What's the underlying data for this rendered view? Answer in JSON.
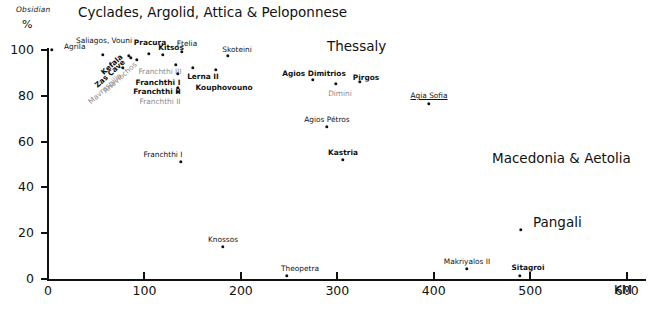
{
  "axes": {
    "y_title": "Obsidian",
    "y_unit": "%",
    "x_unit": "KM",
    "y_ticks": [
      "0",
      "20",
      "40",
      "60",
      "80",
      "100"
    ],
    "x_ticks": [
      "0",
      "100",
      "200",
      "300",
      "400",
      "500",
      "600"
    ]
  },
  "regions": [
    {
      "name": "Cyclades, Argolid, Attica & Peloponnese",
      "x": 78,
      "y": 4
    },
    {
      "name": "Thessaly",
      "x": 327,
      "y": 38
    },
    {
      "name": "Macedonia & Aetolia",
      "x": 492,
      "y": 150
    },
    {
      "name": "Pangali",
      "x": 533,
      "y": 214
    }
  ],
  "chart_data": {
    "type": "scatter",
    "xlabel": "KM",
    "ylabel": "Obsidian %",
    "xlim": [
      0,
      620
    ],
    "ylim": [
      0,
      105
    ],
    "grid": false,
    "legend": "none",
    "points": [
      {
        "label": "Agrila",
        "x": 6,
        "y": 100,
        "px": 52,
        "py": 50,
        "lx": 64,
        "ly": 43,
        "anchor": "left",
        "style": "plain"
      },
      {
        "label": "Saliagos, Vouni",
        "x": 55,
        "y": 97,
        "px": 103,
        "py": 55,
        "lx": 104,
        "ly": 37,
        "anchor": "center",
        "style": "plain"
      },
      {
        "label": "Kefala",
        "x": 82,
        "y": 96,
        "px": 129,
        "py": 56,
        "lx": 112,
        "ly": 61,
        "anchor": "center",
        "style": "rot"
      },
      {
        "label": "Zas Cave",
        "x": 84,
        "y": 94,
        "px": 131,
        "py": 58,
        "lx": 110,
        "ly": 70,
        "anchor": "center",
        "style": "rot"
      },
      {
        "label": "Anavlochos",
        "x": 90,
        "y": 92,
        "px": 137,
        "py": 60,
        "lx": 120,
        "ly": 74,
        "anchor": "center",
        "style": "rot grey"
      },
      {
        "label": "Mavrospilia",
        "x": 76,
        "y": 88,
        "px": 123,
        "py": 68,
        "lx": 105,
        "ly": 85,
        "anchor": "center",
        "style": "rot grey"
      },
      {
        "label": "Pracura",
        "x": 104,
        "y": 97,
        "px": 149,
        "py": 54,
        "lx": 150,
        "ly": 39,
        "anchor": "center",
        "style": "bold"
      },
      {
        "label": "Kitsos",
        "x": 118,
        "y": 96,
        "px": 163,
        "py": 55,
        "lx": 171,
        "ly": 44,
        "anchor": "center",
        "style": "bold"
      },
      {
        "label": "Ftelia",
        "x": 137,
        "y": 97,
        "px": 182,
        "py": 52,
        "lx": 187,
        "ly": 40,
        "anchor": "center",
        "style": "plain"
      },
      {
        "label": "Skoteini",
        "x": 183,
        "y": 96,
        "px": 228,
        "py": 56,
        "lx": 237,
        "ly": 46,
        "anchor": "center",
        "style": "plain"
      },
      {
        "label": "Franchthi III",
        "x": 131,
        "y": 90,
        "px": 176,
        "py": 65,
        "lx": 160,
        "ly": 68,
        "anchor": "center",
        "style": "grey"
      },
      {
        "label": "Franchthi I",
        "x": 133,
        "y": 86,
        "px": 178,
        "py": 74,
        "lx": 158,
        "ly": 79,
        "anchor": "center",
        "style": "bold"
      },
      {
        "label": "Lerna II",
        "x": 148,
        "y": 89,
        "px": 193,
        "py": 68,
        "lx": 203,
        "ly": 73,
        "anchor": "center",
        "style": "bold"
      },
      {
        "label": "Kouphovouno",
        "x": 171,
        "y": 88,
        "px": 216,
        "py": 70,
        "lx": 224,
        "ly": 84,
        "anchor": "center",
        "style": "bold"
      },
      {
        "label": "Franchthi II",
        "x": 133,
        "y": 82,
        "px": 178,
        "py": 88,
        "lx": 157,
        "ly": 88,
        "anchor": "center",
        "style": "bold"
      },
      {
        "label": "Franchthi II",
        "x": 133,
        "y": 80,
        "px": 178,
        "py": 92,
        "lx": 160,
        "ly": 98,
        "anchor": "center",
        "style": "grey"
      },
      {
        "label": "Agios Dimitrios",
        "x": 268,
        "y": 87,
        "px": 313,
        "py": 80,
        "lx": 314,
        "ly": 70,
        "anchor": "center",
        "style": "bold"
      },
      {
        "label": "Pirgos",
        "x": 315,
        "y": 86,
        "px": 360,
        "py": 82,
        "lx": 366,
        "ly": 74,
        "anchor": "center",
        "style": "bold"
      },
      {
        "label": "Dimini",
        "x": 291,
        "y": 85,
        "px": 336,
        "py": 84,
        "lx": 340,
        "ly": 90,
        "anchor": "center",
        "style": "grey"
      },
      {
        "label": "Agia Sofia",
        "x": 384,
        "y": 78,
        "px": 429,
        "py": 104,
        "lx": 429,
        "ly": 92,
        "anchor": "center",
        "style": "und"
      },
      {
        "label": "Agios Pétros",
        "x": 282,
        "y": 69,
        "px": 327,
        "py": 127,
        "lx": 327,
        "ly": 116,
        "anchor": "center",
        "style": "plain"
      },
      {
        "label": "Franchthi I",
        "x": 136,
        "y": 52,
        "px": 181,
        "py": 162,
        "lx": 163,
        "ly": 151,
        "anchor": "center",
        "style": "plain"
      },
      {
        "label": "Kastria",
        "x": 298,
        "y": 53,
        "px": 343,
        "py": 160,
        "lx": 343,
        "ly": 149,
        "anchor": "center",
        "style": "bold"
      },
      {
        "label": "Pangali",
        "x": 502,
        "y": 21,
        "px": 521,
        "py": 230,
        "lx": 521,
        "ly": 214,
        "anchor": "center",
        "style": "none"
      },
      {
        "label": "Knossos",
        "x": 178,
        "y": 13,
        "px": 223,
        "py": 247,
        "lx": 223,
        "ly": 236,
        "anchor": "center",
        "style": "plain"
      },
      {
        "label": "Makriyalos II",
        "x": 447,
        "y": 3,
        "px": 467,
        "py": 269,
        "lx": 467,
        "ly": 258,
        "anchor": "center",
        "style": "plain"
      },
      {
        "label": "Sitagroi",
        "x": 500,
        "y": 1,
        "px": 520,
        "py": 276,
        "lx": 528,
        "ly": 264,
        "anchor": "center",
        "style": "bold"
      },
      {
        "label": "Theopetra",
        "x": 254,
        "y": 1,
        "px": 287,
        "py": 276,
        "lx": 300,
        "ly": 265,
        "anchor": "center",
        "style": "plain"
      }
    ]
  }
}
